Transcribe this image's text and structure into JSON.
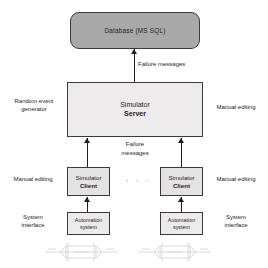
{
  "diagram": {
    "colors": {
      "database_fill": "#a9a9a9",
      "server_fill": "#eceaea",
      "client_fill": "#e4e2e2",
      "automation_fill": "#eceaea",
      "stroke": "#3a3a3a",
      "text": "#1d1d1d"
    },
    "database": {
      "label": "Database (MS SQL)"
    },
    "server": {
      "line1": "Simulator",
      "line2": "Server"
    },
    "clients": [
      {
        "line1": "Simulator",
        "line2": "Client"
      },
      {
        "line1": "Simulator",
        "line2": "Client"
      }
    ],
    "ellipsis": "· · ·",
    "automation_systems": [
      {
        "line1": "Automation",
        "line2": "system"
      },
      {
        "line1": "Automation",
        "line2": "system"
      }
    ],
    "edge_labels": {
      "db_arrow": "Failure messages",
      "server_arrow_line1": "Failure",
      "server_arrow_line2": "messages"
    },
    "side_labels": {
      "random_event_generator": "Random event\ngenerator",
      "manual_editing_server_right": "Manual editing",
      "manual_editing_client_left": "Manual editing",
      "manual_editing_client_right": "Manual editing",
      "system_interface_left": "System\ninterface",
      "system_interface_right": "System\ninterface"
    }
  }
}
